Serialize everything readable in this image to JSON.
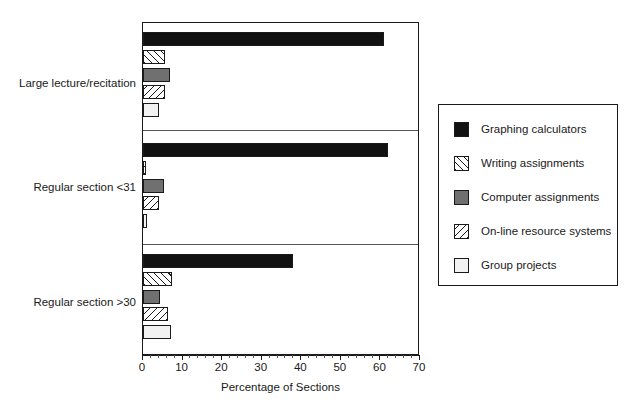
{
  "chart_data": {
    "type": "bar",
    "orientation": "horizontal",
    "title": "",
    "xlabel": "Percentage of Sections",
    "ylabel": "",
    "xlim": [
      0,
      70
    ],
    "ylim": null,
    "grid": false,
    "legend_position": "right",
    "xticks": [
      0,
      10,
      20,
      30,
      40,
      50,
      60,
      70
    ],
    "xticklabels": [
      "0",
      "10",
      "20",
      "30",
      "40",
      "50",
      "60",
      "70"
    ],
    "categories": [
      "Large lecture/recitation",
      "Regular section <31",
      "Regular section >30"
    ],
    "series": [
      {
        "name": "Graphing calculators",
        "fill": "solid-black",
        "color": "#111111",
        "values": [
          61,
          62,
          38
        ]
      },
      {
        "name": "Writing assignments",
        "fill": "hatch-forward",
        "color": "#ffffff",
        "values": [
          5.5,
          0.7,
          7.3
        ]
      },
      {
        "name": "Computer assignments",
        "fill": "solid-gray",
        "color": "#707070",
        "values": [
          6.8,
          5.3,
          4.2
        ]
      },
      {
        "name": "On-line resource systems",
        "fill": "hatch-backward",
        "color": "#ffffff",
        "values": [
          5.5,
          4.0,
          6.3
        ]
      },
      {
        "name": "Group projects",
        "fill": "light",
        "color": "#f2f2f2",
        "values": [
          4.0,
          1.0,
          7.0
        ]
      }
    ]
  },
  "legend": {
    "items": [
      {
        "label": "Graphing calculators"
      },
      {
        "label": "Writing assignments"
      },
      {
        "label": "Computer assignments"
      },
      {
        "label": "On-line resource systems"
      },
      {
        "label": "Group projects"
      }
    ]
  }
}
